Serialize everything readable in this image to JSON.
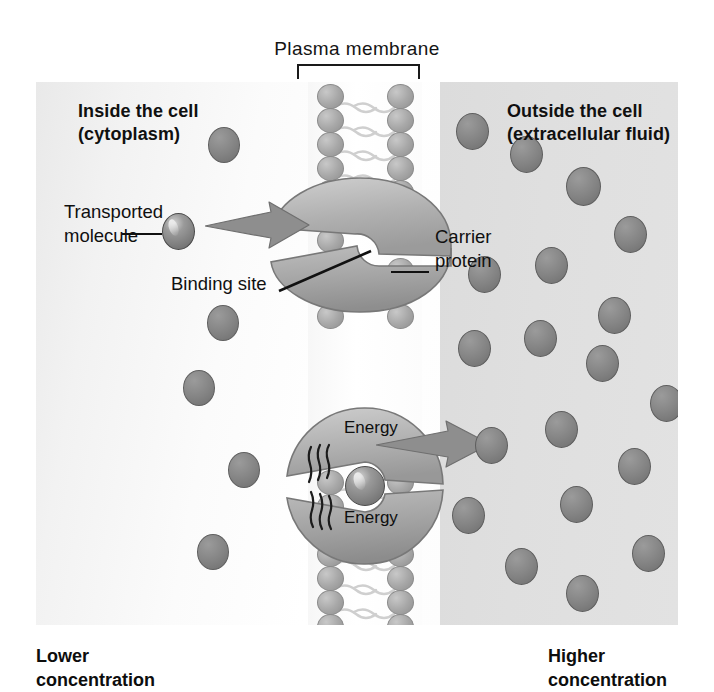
{
  "figure": {
    "type": "biology-diagram",
    "plasma_membrane_label": "Plasma  membrane",
    "bracket": "membrane-span-bracket"
  },
  "labels": {
    "inside_cell": "Inside the cell\n(cytoplasm)",
    "outside_cell": "Outside the cell\n(extracellular fluid)",
    "transported_molecule": "Transported\nmolecule",
    "binding_site": "Binding site",
    "carrier_protein": "Carrier\nprotein",
    "energy_top": "Energy",
    "energy_bottom": "Energy",
    "lower_concentration": "Lower\nconcentration",
    "higher_concentration": "Higher\nconcentration"
  },
  "colors": {
    "molecule": "#838383",
    "lipid_head": "#a8a8a8",
    "protein_light": "#c3c3c3",
    "protein_mid": "#a5a5a5",
    "protein_dark": "#8d8d8d",
    "arrow": "#8c8c8c",
    "cytoplasm_bg": "#f7f7f7",
    "extracellular_bg": "#dfdfdf",
    "text": "#101010"
  },
  "geometry": {
    "frame": {
      "x": 36,
      "y": 82,
      "w": 642,
      "h": 543
    },
    "membrane_band": {
      "x": 290,
      "y": 82,
      "w": 115
    },
    "lipid_head_rows_left": [
      96,
      120,
      144,
      168,
      192,
      505,
      529,
      553,
      577,
      601
    ],
    "lipid_head_rows_right": [
      96,
      120,
      144,
      168,
      192,
      505,
      529,
      553,
      577,
      601
    ]
  },
  "molecules": {
    "inside": [
      {
        "x": 208,
        "y": 127,
        "d": 32
      },
      {
        "x": 207,
        "y": 305,
        "d": 32
      },
      {
        "x": 183,
        "y": 370,
        "d": 32
      },
      {
        "x": 228,
        "y": 452,
        "d": 32
      },
      {
        "x": 197,
        "y": 534,
        "d": 32
      },
      {
        "x": 162,
        "y": 231,
        "d": 31,
        "shiny": true
      }
    ],
    "outside": [
      {
        "x": 456,
        "y": 113,
        "d": 33
      },
      {
        "x": 510,
        "y": 136,
        "d": 33
      },
      {
        "x": 566,
        "y": 167,
        "d": 35
      },
      {
        "x": 614,
        "y": 216,
        "d": 33
      },
      {
        "x": 468,
        "y": 256,
        "d": 33
      },
      {
        "x": 535,
        "y": 247,
        "d": 33
      },
      {
        "x": 598,
        "y": 297,
        "d": 33
      },
      {
        "x": 458,
        "y": 330,
        "d": 33
      },
      {
        "x": 524,
        "y": 320,
        "d": 33
      },
      {
        "x": 586,
        "y": 345,
        "d": 33
      },
      {
        "x": 650,
        "y": 385,
        "d": 33
      },
      {
        "x": 475,
        "y": 427,
        "d": 33
      },
      {
        "x": 545,
        "y": 411,
        "d": 33
      },
      {
        "x": 618,
        "y": 448,
        "d": 33
      },
      {
        "x": 452,
        "y": 497,
        "d": 33
      },
      {
        "x": 505,
        "y": 548,
        "d": 33
      },
      {
        "x": 560,
        "y": 486,
        "d": 33
      },
      {
        "x": 566,
        "y": 575,
        "d": 33
      },
      {
        "x": 632,
        "y": 535,
        "d": 33
      }
    ],
    "bound_in_carrier": {
      "x": 323,
      "y": 444,
      "d": 40,
      "shiny": true
    }
  },
  "arrows": [
    {
      "name": "entry-arrow",
      "direction": "right",
      "x": 205,
      "y": 212
    },
    {
      "name": "exit-arrow",
      "direction": "right",
      "x": 376,
      "y": 437
    }
  ]
}
